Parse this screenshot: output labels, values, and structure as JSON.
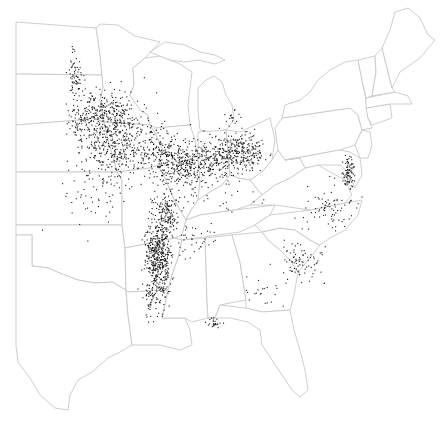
{
  "map": {
    "type": "dot-density",
    "region": "Eastern United States",
    "background_color": "#ffffff",
    "border_color": "#c8c8c8",
    "dot_color": "#1a1a1a",
    "labels": []
  },
  "states": [
    {
      "name": "north-dakota",
      "d": "M16,22 L96,28 L98,40 L100,55 L102,75 L16,74 Z"
    },
    {
      "name": "south-dakota",
      "d": "M16,74 L102,75 L103,88 L100,100 L104,122 L92,118 L80,120 L16,125 Z"
    },
    {
      "name": "nebraska",
      "d": "M16,125 L80,120 L92,118 L104,122 L108,140 L114,160 L117,172 L16,172 Z"
    },
    {
      "name": "kansas",
      "d": "M16,172 L117,172 L122,180 L122,225 L16,225 Z"
    },
    {
      "name": "oklahoma",
      "d": "M16,225 L122,225 L125,248 L126,290 L112,282 L95,283 L78,280 L62,274 L48,268 L32,266 L32,235 L16,235 Z"
    },
    {
      "name": "texas",
      "d": "M16,235 L32,235 L32,266 L48,268 L62,274 L78,280 L95,283 L112,282 L126,290 L128,315 L132,345 L120,352 L108,358 L92,372 L78,380 L70,395 L68,410 L55,408 L40,395 L30,378 L18,362 L16,345 Z"
    },
    {
      "name": "minnesota",
      "d": "M96,28 L100,24 L118,25 L135,36 L152,40 L160,42 L145,58 L133,68 L134,85 L130,95 L140,110 L148,115 L150,125 L104,122 L100,100 L103,88 L102,75 L100,55 L98,40 Z"
    },
    {
      "name": "iowa",
      "d": "M104,122 L150,125 L156,135 L163,150 L158,165 L150,168 L117,172 L114,160 L108,140 Z"
    },
    {
      "name": "missouri",
      "d": "M117,172 L150,168 L158,165 L165,178 L172,195 L180,210 L186,220 L182,235 L175,238 L125,248 L122,225 L122,180 Z"
    },
    {
      "name": "arkansas",
      "d": "M125,248 L175,238 L182,240 L178,258 L172,275 L168,290 L128,292 L126,290 Z"
    },
    {
      "name": "louisiana",
      "d": "M126,290 L128,292 L168,290 L165,305 L162,318 L185,318 L190,330 L192,345 L180,350 L160,345 L145,345 L132,345 L128,315 Z"
    },
    {
      "name": "wisconsin",
      "d": "M133,68 L145,58 L160,56 L180,64 L192,72 L190,88 L188,105 L190,125 L156,128 L150,125 L148,115 L140,110 L130,95 L134,85 Z"
    },
    {
      "name": "illinois",
      "d": "M156,128 L190,125 L195,140 L198,160 L200,180 L198,200 L190,212 L186,220 L180,210 L172,195 L165,178 L158,165 L163,150 L156,135 Z"
    },
    {
      "name": "michigan-upper",
      "d": "M150,52 L165,42 L185,45 L200,52 L215,55 L225,60 L215,64 L198,60 L185,62 L170,60 L160,56 Z"
    },
    {
      "name": "michigan-lower",
      "d": "M198,88 L206,80 L214,76 L222,82 L226,95 L232,105 L234,120 L226,130 L210,132 L200,130 L198,112 Z"
    },
    {
      "name": "indiana",
      "d": "M198,132 L226,130 L228,150 L230,175 L222,185 L210,192 L198,200 L200,180 L198,160 Z"
    },
    {
      "name": "ohio",
      "d": "M226,130 L240,132 L255,125 L270,118 L275,140 L272,160 L262,172 L250,180 L238,178 L230,175 L228,150 Z"
    },
    {
      "name": "kentucky",
      "d": "M186,220 L190,212 L198,200 L210,192 L222,185 L230,175 L238,178 L250,180 L262,195 L250,205 L235,210 L200,215 L186,220 Z"
    },
    {
      "name": "tennessee",
      "d": "M175,238 L182,235 L186,220 L200,215 L235,210 L275,205 L270,215 L255,225 L240,232 L182,240 Z"
    },
    {
      "name": "mississippi",
      "d": "M182,240 L205,238 L206,265 L207,300 L208,318 L192,322 L185,318 L162,318 L165,305 L168,290 L172,275 L178,258 Z"
    },
    {
      "name": "alabama",
      "d": "M205,238 L232,235 L240,262 L246,300 L235,302 L220,305 L215,318 L208,318 L207,300 L206,265 Z"
    },
    {
      "name": "georgia",
      "d": "M232,235 L262,232 L268,240 L280,250 L290,260 L298,272 L294,295 L290,310 L262,312 L246,308 L246,300 L240,262 Z"
    },
    {
      "name": "florida",
      "d": "M208,318 L215,318 L220,305 L246,308 L262,312 L290,310 L294,330 L300,350 L305,370 L308,390 L300,397 L292,390 L282,375 L272,360 L262,345 L260,330 L248,322 L230,318 Z"
    },
    {
      "name": "south-carolina",
      "d": "M262,232 L280,228 L295,230 L310,240 L320,245 L310,258 L298,272 L290,260 L280,250 L268,240 Z"
    },
    {
      "name": "north-carolina",
      "d": "M255,225 L270,215 L310,210 L345,203 L362,200 L358,215 L345,230 L330,238 L320,245 L310,240 L295,230 L280,228 L262,232 Z"
    },
    {
      "name": "virginia",
      "d": "M250,205 L262,195 L275,185 L290,178 L305,168 L318,165 L330,172 L345,180 L352,195 L345,203 L310,210 L275,205 Z"
    },
    {
      "name": "west-virginia",
      "d": "M262,172 L272,160 L278,150 L285,160 L300,158 L305,168 L290,178 L275,185 L262,195 L250,180 Z"
    },
    {
      "name": "pennsylvania",
      "d": "M275,128 L282,118 L350,108 L358,115 L362,130 L355,145 L340,150 L285,160 L278,150 Z"
    },
    {
      "name": "maryland-delaware",
      "d": "M285,160 L340,150 L350,152 L360,158 L362,175 L355,188 L348,172 L340,165 L330,165 L318,165 L305,168 L300,158 Z"
    },
    {
      "name": "new-jersey",
      "d": "M355,145 L362,130 L370,132 L372,145 L368,158 L360,158 Z"
    },
    {
      "name": "new-york",
      "d": "M282,118 L285,105 L300,100 L310,92 L318,80 L330,70 L345,62 L358,60 L362,80 L366,100 L368,118 L372,128 L362,130 L358,115 L350,108 Z"
    },
    {
      "name": "connecticut-ri",
      "d": "M366,108 L390,104 L392,118 L372,125 L368,118 Z"
    },
    {
      "name": "massachusetts",
      "d": "M366,98 L395,92 L408,96 L412,104 L390,104 L366,108 Z"
    },
    {
      "name": "vermont",
      "d": "M358,60 L375,56 L376,72 L372,96 L366,98 L362,80 Z"
    },
    {
      "name": "new-hampshire",
      "d": "M375,56 L382,48 L392,88 L395,92 L372,96 L376,72 Z"
    },
    {
      "name": "maine",
      "d": "M382,48 L390,30 L395,12 L408,8 L420,18 L428,35 L435,40 L420,58 L400,72 L392,88 Z"
    }
  ],
  "dot_clusters": [
    {
      "name": "red-river-valley",
      "cx": 75,
      "cy": 75,
      "rx": 6,
      "ry": 20,
      "count": 70,
      "seed": 11
    },
    {
      "name": "southern-minnesota",
      "cx": 108,
      "cy": 118,
      "rx": 26,
      "ry": 22,
      "count": 330,
      "seed": 23
    },
    {
      "name": "eastern-south-dakota",
      "cx": 82,
      "cy": 120,
      "rx": 14,
      "ry": 16,
      "count": 90,
      "seed": 31
    },
    {
      "name": "iowa",
      "cx": 118,
      "cy": 150,
      "rx": 26,
      "ry": 22,
      "count": 240,
      "seed": 41
    },
    {
      "name": "nebraska-kansas-scatter",
      "cx": 95,
      "cy": 180,
      "rx": 28,
      "ry": 40,
      "count": 90,
      "seed": 47
    },
    {
      "name": "northern-illinois",
      "cx": 160,
      "cy": 150,
      "rx": 22,
      "ry": 20,
      "count": 170,
      "seed": 53
    },
    {
      "name": "central-illinois-indiana",
      "cx": 188,
      "cy": 165,
      "rx": 28,
      "ry": 20,
      "count": 360,
      "seed": 61
    },
    {
      "name": "ohio-west",
      "cx": 225,
      "cy": 155,
      "rx": 20,
      "ry": 18,
      "count": 210,
      "seed": 67
    },
    {
      "name": "ohio-central",
      "cx": 245,
      "cy": 150,
      "rx": 18,
      "ry": 16,
      "count": 150,
      "seed": 71
    },
    {
      "name": "missouri-bootheel",
      "cx": 168,
      "cy": 210,
      "rx": 10,
      "ry": 18,
      "count": 120,
      "seed": 73
    },
    {
      "name": "arkansas-delta",
      "cx": 158,
      "cy": 255,
      "rx": 11,
      "ry": 38,
      "count": 520,
      "seed": 79
    },
    {
      "name": "louisiana-north",
      "cx": 150,
      "cy": 300,
      "rx": 6,
      "ry": 14,
      "count": 40,
      "seed": 83
    },
    {
      "name": "west-tennessee",
      "cx": 195,
      "cy": 240,
      "rx": 22,
      "ry": 14,
      "count": 40,
      "seed": 89
    },
    {
      "name": "south-alabama",
      "cx": 212,
      "cy": 322,
      "rx": 6,
      "ry": 4,
      "count": 25,
      "seed": 97
    },
    {
      "name": "delmarva",
      "cx": 348,
      "cy": 172,
      "rx": 5,
      "ry": 14,
      "count": 85,
      "seed": 101
    },
    {
      "name": "virginia-nc",
      "cx": 330,
      "cy": 210,
      "rx": 22,
      "ry": 20,
      "count": 80,
      "seed": 103
    },
    {
      "name": "south-carolina",
      "cx": 300,
      "cy": 262,
      "rx": 18,
      "ry": 16,
      "count": 80,
      "seed": 107
    },
    {
      "name": "georgia",
      "cx": 262,
      "cy": 290,
      "rx": 18,
      "ry": 14,
      "count": 20,
      "seed": 109
    },
    {
      "name": "michigan-thumb",
      "cx": 230,
      "cy": 115,
      "rx": 6,
      "ry": 6,
      "count": 15,
      "seed": 113
    },
    {
      "name": "kentucky-scatter",
      "cx": 230,
      "cy": 200,
      "rx": 25,
      "ry": 10,
      "count": 15,
      "seed": 127
    }
  ]
}
